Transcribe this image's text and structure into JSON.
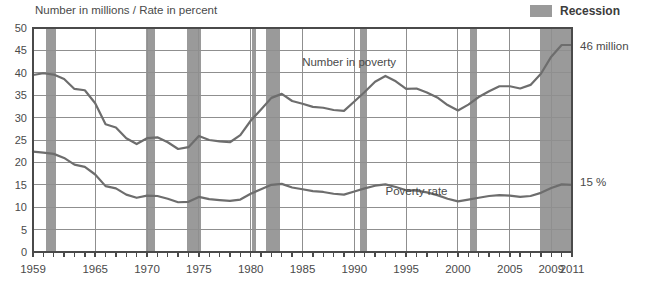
{
  "chart_data": {
    "type": "line",
    "title": "",
    "axis_note": "Number in millions / Rate in percent",
    "xlabel": "",
    "ylabel": "",
    "ylim": [
      0,
      50
    ],
    "ytick_step": 5,
    "yticks": [
      0,
      5,
      10,
      15,
      20,
      25,
      30,
      35,
      40,
      45,
      50
    ],
    "xlim": [
      1959,
      2011
    ],
    "xticks_labeled": [
      1959,
      1965,
      1970,
      1975,
      1980,
      1985,
      1990,
      1995,
      2000,
      2005,
      2009,
      2011
    ],
    "grid": true,
    "legend": [
      {
        "label": "Recession",
        "color": "#9a9a9a",
        "type": "band"
      }
    ],
    "annotations": [
      {
        "text": "Number in poverty",
        "x": 1989.5,
        "y": 41.5,
        "anchor": "middle"
      },
      {
        "text": "Poverty rate",
        "x": 1996.0,
        "y": 12.8,
        "anchor": "middle"
      },
      {
        "text": "46 million",
        "x": 2011,
        "y": 46,
        "anchor": "end-label"
      },
      {
        "text": "15 %",
        "x": 2011,
        "y": 15,
        "anchor": "end-label"
      }
    ],
    "x": [
      1959,
      1960,
      1961,
      1962,
      1963,
      1964,
      1965,
      1966,
      1967,
      1968,
      1969,
      1970,
      1971,
      1972,
      1973,
      1974,
      1975,
      1976,
      1977,
      1978,
      1979,
      1980,
      1981,
      1982,
      1983,
      1984,
      1985,
      1986,
      1987,
      1988,
      1989,
      1990,
      1991,
      1992,
      1993,
      1994,
      1995,
      1996,
      1997,
      1998,
      1999,
      2000,
      2001,
      2002,
      2003,
      2004,
      2005,
      2006,
      2007,
      2008,
      2009,
      2010,
      2011
    ],
    "series": [
      {
        "name": "Number in poverty",
        "unit": "millions",
        "color": "#6d6d6d",
        "values": [
          39.5,
          39.9,
          39.6,
          38.6,
          36.4,
          36.1,
          33.2,
          28.5,
          27.8,
          25.4,
          24.1,
          25.4,
          25.6,
          24.5,
          23.0,
          23.4,
          25.9,
          25.0,
          24.7,
          24.5,
          26.1,
          29.3,
          31.8,
          34.4,
          35.3,
          33.7,
          33.1,
          32.4,
          32.2,
          31.7,
          31.5,
          33.6,
          35.7,
          38.0,
          39.3,
          38.1,
          36.4,
          36.5,
          35.6,
          34.5,
          32.8,
          31.6,
          32.9,
          34.6,
          35.9,
          37.0,
          37.0,
          36.5,
          37.3,
          39.8,
          43.6,
          46.2,
          46.2
        ]
      },
      {
        "name": "Poverty rate",
        "unit": "percent",
        "color": "#6d6d6d",
        "values": [
          22.4,
          22.2,
          21.9,
          21.0,
          19.5,
          19.0,
          17.3,
          14.7,
          14.2,
          12.8,
          12.1,
          12.6,
          12.5,
          11.9,
          11.1,
          11.2,
          12.3,
          11.8,
          11.6,
          11.4,
          11.7,
          13.0,
          14.0,
          15.0,
          15.2,
          14.4,
          14.0,
          13.6,
          13.4,
          13.0,
          12.8,
          13.5,
          14.2,
          14.8,
          15.1,
          14.5,
          13.8,
          13.7,
          13.3,
          12.7,
          11.9,
          11.3,
          11.7,
          12.1,
          12.5,
          12.7,
          12.6,
          12.3,
          12.5,
          13.2,
          14.3,
          15.1,
          15.0
        ]
      }
    ],
    "recession_bands": [
      {
        "start": 1960.3,
        "end": 1961.2,
        "label": "1960-61"
      },
      {
        "start": 1969.9,
        "end": 1970.8,
        "label": "1969-70"
      },
      {
        "start": 1973.9,
        "end": 1975.2,
        "label": "1973-75"
      },
      {
        "start": 1980.1,
        "end": 1980.5,
        "label": "1980"
      },
      {
        "start": 1981.5,
        "end": 1982.8,
        "label": "1981-82"
      },
      {
        "start": 1990.5,
        "end": 1991.2,
        "label": "1990-91"
      },
      {
        "start": 2001.2,
        "end": 2001.8,
        "label": "2001"
      },
      {
        "start": 2007.9,
        "end": 2011.0,
        "label": "2007-"
      }
    ]
  },
  "legend": {
    "recession_label": "Recession",
    "recession_color": "#9a9a9a"
  },
  "labels": {
    "header_note": "Number in millions / Rate in percent",
    "number_in_poverty": "Number in poverty",
    "poverty_rate": "Poverty rate",
    "end_value_millions": "46 million",
    "end_value_rate": "15 %"
  }
}
